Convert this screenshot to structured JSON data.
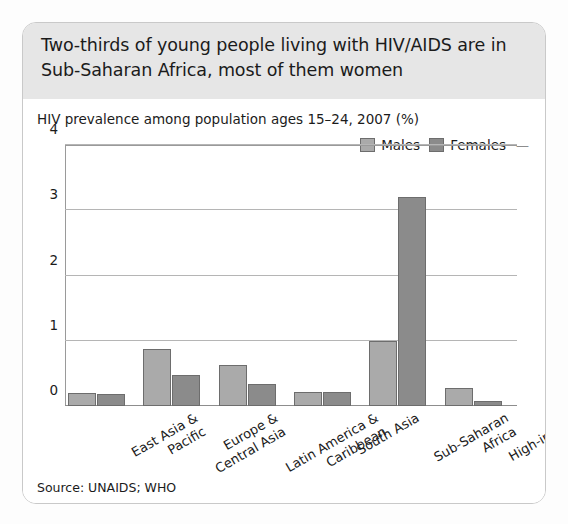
{
  "card": {
    "headline": "Two-thirds of young people living with HIV/AIDS are in Sub-Saharan Africa, most of them women",
    "source": "Source: UNAIDS; WHO"
  },
  "legend": {
    "males_label": "Males",
    "females_label": "Females",
    "tail": "—",
    "males_color": "#aaaaaa",
    "females_color": "#8b8b8b"
  },
  "chart_data": {
    "type": "bar",
    "title": "HIV prevalence among population ages 15–24, 2007 (%)",
    "xlabel": "",
    "ylabel": "",
    "ylim": [
      0,
      4
    ],
    "yticks": [
      0,
      1,
      2,
      3,
      4
    ],
    "ytick_labels": [
      "0",
      "1",
      "2",
      "3",
      "4"
    ],
    "grid": true,
    "legend_position": "top-right",
    "categories": [
      "East Asia & Pacific",
      "Europe & Central Asia",
      "Latin America & Caribbean",
      "South Asia",
      "Sub-Saharan Africa",
      "High-income"
    ],
    "category_lines": [
      [
        "East Asia &",
        "Pacific"
      ],
      [
        "Europe &",
        "Central Asia"
      ],
      [
        "Latin America &",
        "Caribbean"
      ],
      [
        "South Asia"
      ],
      [
        "Sub-Saharan",
        "Africa"
      ],
      [
        "High-income"
      ]
    ],
    "series": [
      {
        "name": "Males",
        "color": "#aaaaaa",
        "values": [
          0.2,
          0.88,
          0.63,
          0.22,
          1.0,
          0.27
        ]
      },
      {
        "name": "Females",
        "color": "#8b8b8b",
        "values": [
          0.19,
          0.47,
          0.33,
          0.21,
          3.2,
          0.08
        ]
      }
    ]
  }
}
